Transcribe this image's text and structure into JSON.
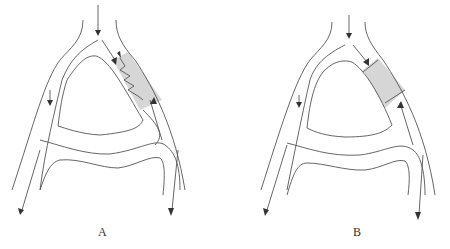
{
  "figure": {
    "panels": [
      {
        "id": "A",
        "label": "A",
        "feature": "shaded vessel segment with zigzag line and opposing arrows",
        "shade_color": "#d6d6d6"
      },
      {
        "id": "B",
        "label": "B",
        "feature": "shaded vessel segment bounded by two transverse bands",
        "shade_color": "#d6d6d6"
      }
    ]
  }
}
